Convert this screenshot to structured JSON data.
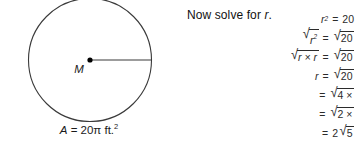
{
  "figure": {
    "shape_name": "circle",
    "center_label": "M",
    "radius_label": "",
    "area_label": {
      "variable": "A",
      "equals": " = ",
      "value": "20",
      "pi_symbol": "π",
      "unit": " ft.",
      "exponent": "2",
      "full_text": "A = 20π ft.²"
    },
    "stroke_color": "#3a3a3a",
    "center_dot_color": "#000000"
  },
  "solution": {
    "prompt_prefix": "Now solve for ",
    "prompt_variable": "r",
    "prompt_suffix": ".",
    "prompt_full": "Now solve for r.",
    "steps": [
      {
        "lhs_base": "r",
        "lhs_exponent": "2",
        "lhs_radical": false,
        "operator": "=",
        "rhs_value": "20",
        "rhs_radical": false,
        "clipped": false
      },
      {
        "lhs_base": "r",
        "lhs_exponent": "2",
        "lhs_radical": true,
        "operator": "=",
        "rhs_value": "20",
        "rhs_radical": true,
        "clipped": false
      },
      {
        "lhs_base": "r × r",
        "lhs_exponent": "",
        "lhs_radical": true,
        "operator": "=",
        "rhs_value": "20",
        "rhs_radical": true,
        "clipped": false
      },
      {
        "lhs_base": "r",
        "lhs_exponent": "",
        "lhs_radical": false,
        "operator": "=",
        "rhs_value": "20",
        "rhs_radical": true,
        "clipped": false
      },
      {
        "lhs_base": "",
        "lhs_exponent": "",
        "lhs_radical": false,
        "operator": "=",
        "rhs_value": "4 ×",
        "rhs_radical": true,
        "clipped": true
      },
      {
        "lhs_base": "",
        "lhs_exponent": "",
        "lhs_radical": false,
        "operator": "=",
        "rhs_value": "2 ×",
        "rhs_radical": true,
        "clipped": true
      },
      {
        "lhs_base": "",
        "lhs_exponent": "",
        "lhs_radical": false,
        "operator": "=",
        "rhs_coefficient": "2",
        "rhs_value": "5",
        "rhs_radical": true,
        "clipped": false
      }
    ]
  },
  "colors": {
    "background": "#ffffff",
    "ink": "#1a1a1a",
    "figure_stroke": "#3a3a3a",
    "equation_ink": "#2b2b2b"
  }
}
